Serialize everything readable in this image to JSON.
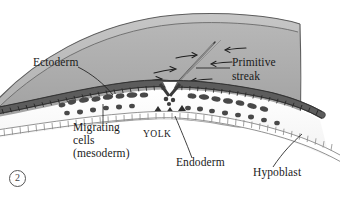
{
  "figure": {
    "number_label": "2",
    "kind": "biology-illustration"
  },
  "labels": [
    {
      "id": "ectoderm",
      "text": "Ectoderm",
      "x": 33,
      "y": 62
    },
    {
      "id": "primitive_streak_line1",
      "text": "Primitive",
      "x": 232,
      "y": 62
    },
    {
      "id": "primitive_streak_line2",
      "text": "streak",
      "x": 232,
      "y": 76
    },
    {
      "id": "migrating_line1",
      "text": "Migrating",
      "x": 73,
      "y": 127
    },
    {
      "id": "migrating_line2",
      "text": "cells",
      "x": 73,
      "y": 140
    },
    {
      "id": "migrating_line3",
      "text": "(mesoderm)",
      "x": 73,
      "y": 153
    },
    {
      "id": "yolk",
      "text": "YOLK",
      "x": 143,
      "y": 133
    },
    {
      "id": "endoderm",
      "text": "Endoderm",
      "x": 176,
      "y": 162
    },
    {
      "id": "hypoblast",
      "text": "Hypoblast",
      "x": 253,
      "y": 172
    }
  ],
  "structures": [
    {
      "id": "gray-dome",
      "name": "yolk-mass-dome",
      "color": "#a9a9a9"
    },
    {
      "id": "epiblast-layer",
      "name": "ectoderm-epiblast",
      "color": "#4a4a4a"
    },
    {
      "id": "hypoblast-layer",
      "name": "hypoblast-endoderm",
      "color": "#7d7d7d"
    },
    {
      "id": "mesoderm-cells",
      "name": "migrating-mesoderm-cells",
      "color": "#4a4a4a"
    },
    {
      "id": "primitive-streak",
      "name": "primitive-streak-groove",
      "color": "#333333"
    }
  ],
  "colors": {
    "background": "#ffffff",
    "dome_fill": "#a9a9a9",
    "dome_fill_light": "#bdbdbd",
    "dome_edge": "#555555",
    "cell_dark": "#4a4a4a",
    "cell_outline": "#6f6f6f",
    "cavity": "#fcfcfc",
    "text": "#1a1a1a"
  },
  "arrow_count": 6
}
